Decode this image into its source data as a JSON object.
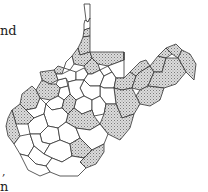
{
  "text_fragments": [
    "nd",
    ",",
    "n"
  ],
  "map": {
    "subject": "West Virginia counties",
    "legend": {
      "shaded": "stippled gray fill",
      "plain": "white fill"
    },
    "colors": {
      "stroke": "#333333",
      "shaded_dot": "#8a8a8a",
      "shaded_bg": "#d9d9d9",
      "plain": "#ffffff"
    },
    "counties": [
      {
        "id": "hancock",
        "shaded": false,
        "points": "84,4 90,4 90,18 88,22 86,20 85,12"
      },
      {
        "id": "brooke",
        "shaded": false,
        "points": "85,20 88,22 90,18 90,28 84,30 84,24"
      },
      {
        "id": "ohio",
        "shaded": true,
        "points": "84,30 90,28 90,36 83,37"
      },
      {
        "id": "marshall",
        "shaded": true,
        "points": "83,37 90,36 90,52 80,55 78,48 81,42"
      },
      {
        "id": "wetzel",
        "shaded": true,
        "points": "78,48 80,55 90,52 92,58 84,66 74,64 72,56"
      },
      {
        "id": "tyler",
        "shaded": false,
        "points": "66,62 72,56 74,64 70,70 64,68"
      },
      {
        "id": "pleasants",
        "shaded": true,
        "points": "58,66 64,68 62,74 56,74 54,70"
      },
      {
        "id": "wood",
        "shaded": true,
        "points": "40,72 54,70 56,74 58,80 50,84 42,80"
      },
      {
        "id": "wirt",
        "shaded": false,
        "points": "58,80 66,78 68,86 60,88 56,84"
      },
      {
        "id": "ritchie",
        "shaded": false,
        "points": "62,74 70,70 76,72 76,80 68,82 66,78 58,80 56,74"
      },
      {
        "id": "doddridge",
        "shaded": false,
        "points": "76,72 84,68 88,74 84,80 76,80"
      },
      {
        "id": "monongalia",
        "shaded": true,
        "points": "90,52 124,52 124,60 108,66 98,64 92,58"
      },
      {
        "id": "marion",
        "shaded": true,
        "points": "84,66 92,58 98,64 100,70 92,74 88,74"
      },
      {
        "id": "harrison",
        "shaded": false,
        "points": "84,80 88,74 92,74 100,70 104,76 100,86 90,86"
      },
      {
        "id": "taylor",
        "shaded": false,
        "points": "100,70 108,66 112,72 104,76"
      },
      {
        "id": "preston",
        "shaded": false,
        "points": "108,66 124,60 124,52 124,78 116,78 112,72"
      },
      {
        "id": "barbour",
        "shaded": false,
        "points": "104,76 112,72 116,78 114,88 104,88 100,86"
      },
      {
        "id": "tucker",
        "shaded": true,
        "points": "116,78 124,78 130,72 136,76 132,88 122,90 114,88"
      },
      {
        "id": "mineral",
        "shaded": true,
        "points": "130,72 140,62 146,60 150,66 140,72 136,76"
      },
      {
        "id": "grant",
        "shaded": true,
        "points": "136,76 140,72 150,66 154,72 148,86 140,90 132,88"
      },
      {
        "id": "hampshire",
        "shaded": true,
        "points": "150,66 158,56 166,58 162,72 154,72"
      },
      {
        "id": "morgan",
        "shaded": true,
        "points": "158,56 166,48 172,54 166,58"
      },
      {
        "id": "berkeley",
        "shaded": true,
        "points": "172,54 166,48 176,44 182,50 178,58"
      },
      {
        "id": "jefferson",
        "shaded": true,
        "points": "182,50 190,54 196,64 194,80 186,72 178,58"
      },
      {
        "id": "hardy",
        "shaded": true,
        "points": "154,72 162,72 166,58 178,58 186,72 176,84 164,88 148,86"
      },
      {
        "id": "pendleton",
        "shaded": true,
        "points": "140,90 148,86 164,88 160,100 150,106 140,104 136,96"
      },
      {
        "id": "randolph",
        "shaded": true,
        "points": "114,88 122,90 132,88 136,96 140,104 134,114 122,118 116,104"
      },
      {
        "id": "upshur",
        "shaded": false,
        "points": "100,86 104,88 114,88 116,104 106,104 100,96"
      },
      {
        "id": "lewis",
        "shaded": false,
        "points": "84,80 90,86 100,86 100,96 92,100 84,96 80,88"
      },
      {
        "id": "gilmer",
        "shaded": false,
        "points": "68,82 76,80 84,80 80,88 84,96 76,100 70,94"
      },
      {
        "id": "calhoun",
        "shaded": false,
        "points": "60,88 68,86 70,94 64,100 58,96"
      },
      {
        "id": "jackson",
        "shaded": true,
        "points": "42,80 50,84 56,84 60,88 58,96 50,100 40,98 36,90"
      },
      {
        "id": "mason",
        "shaded": true,
        "points": "22,94 32,86 36,90 40,98 36,108 26,110 20,104"
      },
      {
        "id": "roane",
        "shaded": false,
        "points": "50,100 58,96 64,100 62,108 52,110 46,104"
      },
      {
        "id": "braxton",
        "shaded": false,
        "points": "76,100 84,96 92,100 92,110 82,114 74,108"
      },
      {
        "id": "webster",
        "shaded": false,
        "points": "92,100 100,96 106,104 104,114 94,116 92,110"
      },
      {
        "id": "pocahontas",
        "shaded": true,
        "points": "104,114 106,104 116,104 122,118 134,114 130,128 120,140 108,134 100,124"
      },
      {
        "id": "clay",
        "shaded": true,
        "points": "62,108 64,100 70,94 76,100 74,108 68,114"
      },
      {
        "id": "nicholas",
        "shaded": true,
        "points": "68,114 74,108 82,114 92,110 94,116 100,124 90,130 76,128 66,122"
      },
      {
        "id": "putnam",
        "shaded": false,
        "points": "26,110 36,108 40,98 46,104 44,114 34,118"
      },
      {
        "id": "kanawha",
        "shaded": false,
        "points": "44,114 46,104 52,110 62,108 68,114 66,122 58,128 48,126"
      },
      {
        "id": "cabell",
        "shaded": true,
        "points": "12,110 20,104 26,110 34,118 28,124 16,124"
      },
      {
        "id": "wayne",
        "shaded": true,
        "points": "8,118 12,110 16,124 20,136 14,144 8,136 6,126"
      },
      {
        "id": "lincoln",
        "shaded": false,
        "points": "28,124 34,118 44,114 48,126 40,134 30,134"
      },
      {
        "id": "boone",
        "shaded": false,
        "points": "40,134 48,126 58,128 60,140 50,144 42,142"
      },
      {
        "id": "fayette",
        "shaded": false,
        "points": "58,128 66,122 76,128 80,138 70,144 60,140"
      },
      {
        "id": "greenbrier",
        "shaded": false,
        "points": "76,128 90,130 100,124 108,134 104,144 92,150 80,138"
      },
      {
        "id": "mingo",
        "shaded": false,
        "points": "14,144 20,136 30,134 34,146 28,156 20,154"
      },
      {
        "id": "logan",
        "shaded": false,
        "points": "30,134 40,134 42,142 50,144 44,154 34,146"
      },
      {
        "id": "raleigh",
        "shaded": false,
        "points": "50,144 60,140 70,144 72,156 62,162 52,158 44,154"
      },
      {
        "id": "wyoming",
        "shaded": false,
        "points": "34,146 44,154 52,158 46,166 36,164 28,156"
      },
      {
        "id": "summers",
        "shaded": true,
        "points": "70,144 80,138 92,150 84,158 72,156"
      },
      {
        "id": "monroe",
        "shaded": true,
        "points": "84,158 92,150 104,144 104,152 96,164 86,168 80,162"
      },
      {
        "id": "mercer",
        "shaded": false,
        "points": "46,166 52,158 62,162 72,156 84,158 80,162 86,168 78,176 60,176 50,172"
      },
      {
        "id": "mcdowell",
        "shaded": false,
        "points": "20,154 28,156 36,164 46,166 50,172 40,176 28,170"
      }
    ]
  }
}
